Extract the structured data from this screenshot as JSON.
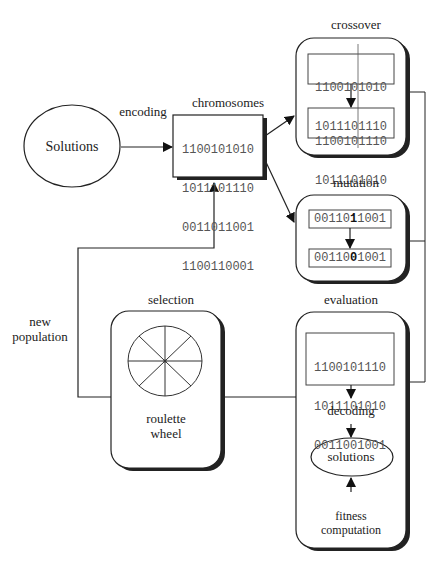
{
  "diagram": {
    "nodes": {
      "solutions": {
        "label": "Solutions"
      },
      "encoding": {
        "label": "encoding"
      },
      "chromosomes": {
        "label": "chromosomes",
        "strings": [
          "1100101010",
          "1011101110",
          "0011011001",
          "1100110001"
        ]
      },
      "crossover": {
        "label": "crossover",
        "parents": [
          "1100101010",
          "1011101110"
        ],
        "offspring": [
          "1100101110",
          "1011101010"
        ]
      },
      "mutation": {
        "label": "mutation",
        "before": {
          "prefix": "00110",
          "bit": "1",
          "suffix": "1001"
        },
        "after": {
          "prefix": "00110",
          "bit": "0",
          "suffix": "1001"
        }
      },
      "evaluation": {
        "label": "evaluation",
        "strings": [
          "1100101110",
          "1011101010",
          "0011001001"
        ],
        "decoding": "decoding",
        "solutions": "solutions",
        "fitness_line1": "fitness",
        "fitness_line2": "computation"
      },
      "selection": {
        "label": "selection",
        "wheel_line1": "roulette",
        "wheel_line2": "wheel"
      },
      "new_population": {
        "line1": "new",
        "line2": "population"
      }
    }
  }
}
